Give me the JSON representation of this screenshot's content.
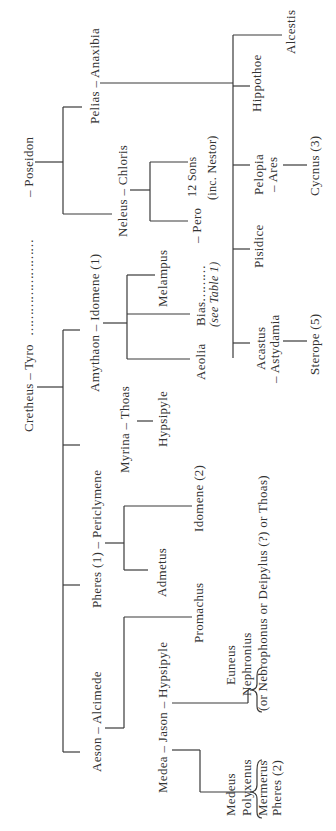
{
  "diagram": {
    "type": "genealogy",
    "orientation": "rotated-90-ccw",
    "nodes": {
      "cretheus_tyro": "Cretheus – Tyro",
      "tyro_dots": "……………………",
      "poseidon": "– Poseidon",
      "pelias_anaxibia": "Pelias – Anaxibia",
      "neleus_chloris": "Neleus – Chloris",
      "twelve_sons": "12 Sons",
      "inc_nestor": "(inc. Nestor)",
      "pero": "– Pero",
      "bias": "Bias",
      "bias_dots": "………",
      "see_table": "(see Table 1)",
      "amythaon_idomene": "Amythaon – Idomene (1)",
      "melampus": "Melampus",
      "aeolia": "Aeolia",
      "myrina_thoas": "Myrina – Thoas",
      "hypsipyle_child": "Hypsipyle",
      "pheres_periclymene": "Pheres (1) – Periclymene",
      "idomene2": "Idomene (2)",
      "admetus": "Admetus",
      "aeson_alcimede": "Aeson – Alcimede",
      "promachus": "Promachus",
      "medea_jason_hypsipyle": "Medea – Jason – Hypsipyle",
      "hippothoe": "Hippothoe",
      "alcestis": "Alcestis",
      "pelopia": "Pelopia",
      "ares": "– Ares",
      "cycnus": "Cycnus (3)",
      "pisidice": "Pisidice",
      "acastus": "Acastus",
      "astydamia": "– Astydamia",
      "sterope": "Sterope (5)"
    },
    "hypsipyle_children": [
      "Euneus",
      "Nephronius",
      "(or Nebrophonus or Deipylus (?) or Thoas)"
    ],
    "medea_children": [
      "Medeus",
      "Polyxenus",
      "Mermerus",
      "Pheres (2)"
    ]
  }
}
